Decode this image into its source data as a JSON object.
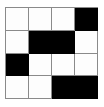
{
  "puzzle": {
    "title": "nonogram-grid",
    "rows": 4,
    "columns": 4,
    "colors": {
      "filled": "#000000",
      "empty": "#fdfdfd",
      "gridline": "#8a8a8a",
      "background": "#ffffff"
    },
    "legend": {
      "filled_value": 1,
      "empty_value": 0
    },
    "cells": [
      [
        0,
        0,
        0,
        1
      ],
      [
        0,
        1,
        1,
        0
      ],
      [
        1,
        0,
        0,
        0
      ],
      [
        0,
        0,
        1,
        1
      ]
    ],
    "filled_count": 6,
    "empty_count": 10
  }
}
